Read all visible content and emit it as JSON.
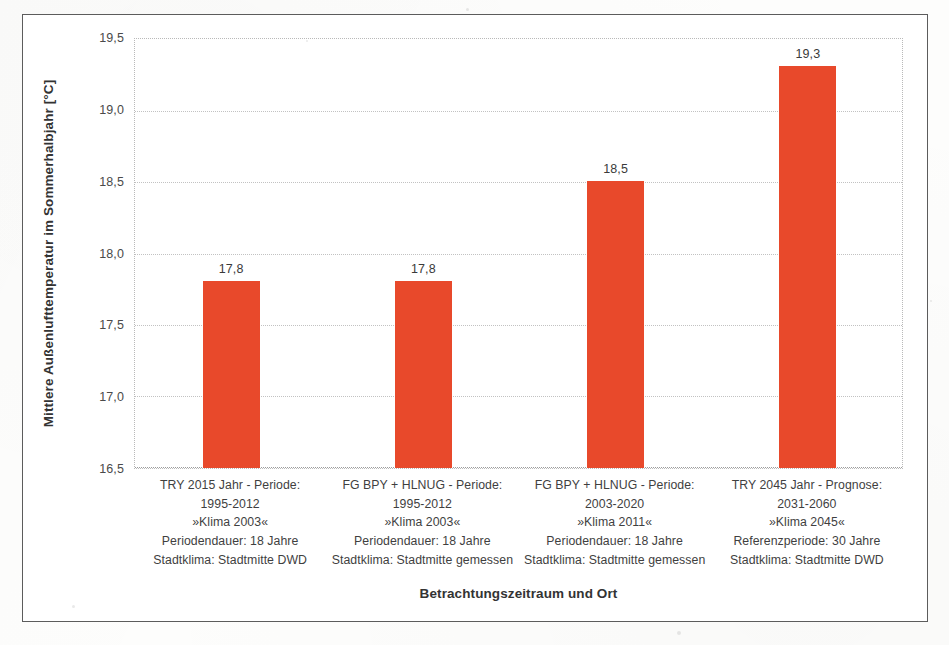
{
  "chart_data": {
    "type": "bar",
    "title": "",
    "xlabel": "Betrachtungszeitraum und Ort",
    "ylabel": "Mittlere Außenlufttemperatur im Sommerhalbjahr [°C]",
    "ylim": [
      16.5,
      19.5
    ],
    "ytick_step": 0.5,
    "ytick_labels": [
      "19,5",
      "19,0",
      "18,5",
      "18,0",
      "17,5",
      "17,0",
      "16,5"
    ],
    "ytick_values": [
      19.5,
      19.0,
      18.5,
      18.0,
      17.5,
      17.0,
      16.5
    ],
    "grid": true,
    "legend": null,
    "bar_color": "#e8492b",
    "categories": [
      "TRY 2015 Jahr - Periode: 1995-2012 »Klima 2003« Periodendauer: 18 Jahre Stadtklima: Stadtmitte DWD",
      "FG BPY + HLNUG - Periode: 1995-2012 »Klima 2003« Periodendauer: 18 Jahre Stadtklima: Stadtmitte gemessen",
      "FG BPY + HLNUG - Periode: 2003-2020 »Klima 2011« Periodendauer: 18 Jahre Stadtklima: Stadtmitte gemessen",
      "TRY 2045 Jahr - Prognose: 2031-2060 »Klima 2045« Referenzperiode: 30 Jahre Stadtklima: Stadtmitte DWD"
    ],
    "category_lines": [
      [
        "TRY 2015 Jahr - Periode:",
        "1995-2012",
        "»Klima 2003«",
        "Periodendauer: 18 Jahre",
        "Stadtklima: Stadtmitte DWD"
      ],
      [
        "FG BPY + HLNUG - Periode:",
        "1995-2012",
        "»Klima 2003«",
        "Periodendauer: 18 Jahre",
        "Stadtklima: Stadtmitte gemessen"
      ],
      [
        "FG BPY + HLNUG - Periode:",
        "2003-2020",
        "»Klima 2011«",
        "Periodendauer: 18 Jahre",
        "Stadtklima: Stadtmitte gemessen"
      ],
      [
        "TRY 2045 Jahr - Prognose:",
        "2031-2060",
        "»Klima 2045«",
        "Referenzperiode: 30 Jahre",
        "Stadtklima: Stadtmitte DWD"
      ]
    ],
    "values": [
      17.8,
      17.8,
      18.5,
      19.3
    ],
    "value_labels": [
      "17,8",
      "17,8",
      "18,5",
      "19,3"
    ]
  }
}
